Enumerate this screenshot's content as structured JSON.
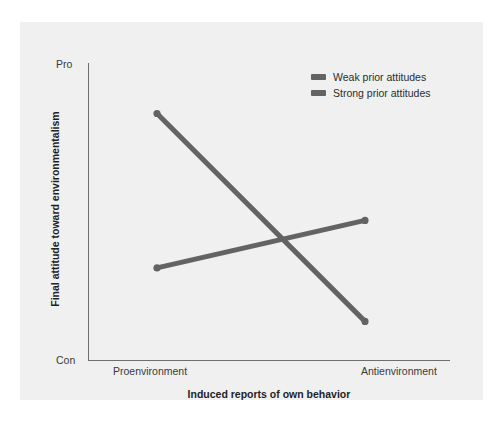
{
  "chart_data": {
    "type": "line",
    "title": "",
    "subtitle": "",
    "xlabel": "Induced reports of own behavior",
    "ylabel": "Final attitude toward environmentalism",
    "categories": [
      "Proenvironment",
      "Antienvironment"
    ],
    "x_tick_labels": [
      "Proenvironment",
      "Antienvironment"
    ],
    "y_tick_labels": [
      "Con",
      "Pro"
    ],
    "ylim": [
      "Con",
      "Pro"
    ],
    "ylim_numeric": [
      0,
      100
    ],
    "grid": false,
    "legend_position": "top-right",
    "annotations": [],
    "series": [
      {
        "name": "Weak prior attitudes",
        "color": "#636363",
        "values": [
          83,
          13
        ],
        "points": [
          {
            "x": "Proenvironment",
            "y": 83
          },
          {
            "x": "Antienvironment",
            "y": 13
          }
        ]
      },
      {
        "name": "Strong prior attitudes",
        "color": "#636363",
        "values": [
          31,
          47
        ],
        "points": [
          {
            "x": "Proenvironment",
            "y": 31
          },
          {
            "x": "Antienvironment",
            "y": 47
          }
        ]
      }
    ]
  },
  "axes": {
    "y_top_label": "Pro",
    "y_bottom_label": "Con",
    "x_left_label": "Proenvironment",
    "x_right_label": "Antienvironment",
    "y_axis_title": "Final attitude toward environmentalism",
    "x_axis_title": "Induced reports of own behavior"
  },
  "legend": {
    "items": [
      {
        "label": "Weak prior attitudes",
        "color": "#636363"
      },
      {
        "label": "Strong prior attitudes",
        "color": "#636363"
      }
    ]
  },
  "colors": {
    "page_background": "#ffffff",
    "panel_background": "#f0f0f0",
    "axis_line": "#6e6e6e",
    "series_line": "#636363",
    "tick_text": "#3a3a3a",
    "title_text": "#1f1f1f"
  }
}
